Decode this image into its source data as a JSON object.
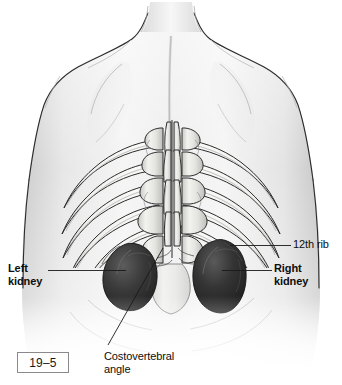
{
  "figure": {
    "number": "19–5",
    "background_color": "#ffffff",
    "line_color": "#1a1a1a",
    "skin_light": "#f2f2f2",
    "skin_mid": "#dcdcdc",
    "skin_shadow": "#b9b9b9",
    "bone_light": "#f6f6f4",
    "bone_shadow": "#9a9a9a",
    "kidney_dark": "#2a2a2a",
    "kidney_mid": "#4a4a4a"
  },
  "labels": {
    "left_kidney": {
      "text": "Left\nkidney",
      "weight": "bold"
    },
    "right_kidney": {
      "text": "Right\nkidney",
      "weight": "bold"
    },
    "twelfth_rib": {
      "text": "12th rib",
      "weight": "regular"
    },
    "costovertebral_angle": {
      "text": "Costovertebral\nangle",
      "weight": "regular"
    }
  },
  "anatomy": {
    "view": "posterior",
    "structures": [
      "neck",
      "shoulders",
      "scapulae",
      "vertebral-column",
      "rib-cage",
      "left-kidney",
      "right-kidney",
      "iliac-crest"
    ]
  }
}
